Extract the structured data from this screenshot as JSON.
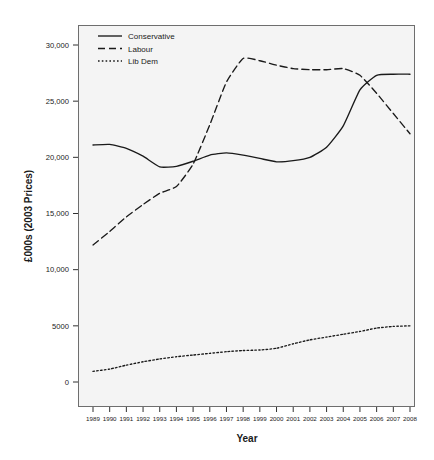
{
  "chart_data": {
    "type": "line",
    "title": "",
    "xlabel": "Year",
    "ylabel": "£000s (2003 Prices)",
    "x": [
      1989,
      1990,
      1991,
      1992,
      1993,
      1994,
      1995,
      1996,
      1997,
      1998,
      1999,
      2000,
      2001,
      2002,
      2003,
      2004,
      2005,
      2006,
      2007,
      2008
    ],
    "categories": [
      "1989",
      "1990",
      "1991",
      "1992",
      "1993",
      "1994",
      "1995",
      "1996",
      "1997",
      "1998",
      "1999",
      "2000",
      "2001",
      "2002",
      "2003",
      "2004",
      "2005",
      "2006",
      "2007",
      "2008"
    ],
    "xlim": [
      1989,
      2008
    ],
    "ylim": [
      -1500,
      31500
    ],
    "yticks": [
      0,
      5000,
      10000,
      15000,
      20000,
      25000,
      30000
    ],
    "ytick_labels": [
      "0",
      "5000",
      "10,000",
      "15,000",
      "20,000",
      "25,000",
      "30,000"
    ],
    "grid": false,
    "legend_position": "top-left",
    "series": [
      {
        "name": "Conservative",
        "style": "solid",
        "color": "#1a1a1a",
        "values": [
          21100,
          21150,
          20800,
          20100,
          19150,
          19200,
          19650,
          20200,
          20400,
          20200,
          19900,
          19600,
          19700,
          20000,
          20900,
          22800,
          26000,
          27300,
          27400,
          27400
        ]
      },
      {
        "name": "Labour",
        "style": "dashed",
        "color": "#1a1a1a",
        "values": [
          12200,
          13400,
          14700,
          15800,
          16800,
          17400,
          19400,
          22900,
          26700,
          28800,
          28600,
          28200,
          27900,
          27800,
          27800,
          27900,
          27300,
          25700,
          23900,
          22100
        ]
      },
      {
        "name": "Lib Dem",
        "style": "dotted",
        "color": "#1a1a1a",
        "values": [
          950,
          1150,
          1500,
          1800,
          2050,
          2250,
          2400,
          2550,
          2700,
          2800,
          2850,
          3000,
          3400,
          3750,
          4000,
          4250,
          4500,
          4800,
          4950,
          5000
        ]
      }
    ],
    "legend": [
      {
        "label": "Conservative",
        "style": "solid"
      },
      {
        "label": "Labour",
        "style": "dashed"
      },
      {
        "label": "Lib Dem",
        "style": "dotted"
      }
    ],
    "colors": {
      "panel_background": "#f4f4f4",
      "panel_border": "#6e6e6e",
      "line": "#1a1a1a",
      "text": "#1a1a1a",
      "page_background": "#ffffff"
    }
  }
}
